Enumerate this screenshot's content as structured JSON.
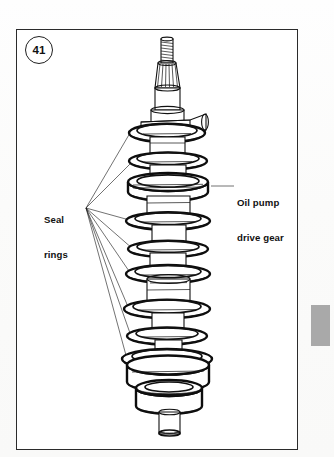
{
  "figure": {
    "number": "41",
    "frame_color": "#2b2b2b",
    "background_color": "#ffffff"
  },
  "labels": {
    "seal_rings": {
      "line1": "Seal",
      "line2": "rings",
      "text": "Seal\nrings"
    },
    "oil_pump_drive_gear": {
      "line1": "Oil pump",
      "line2": "drive gear",
      "text": "Oil pump\ndrive gear"
    }
  },
  "edge_tab": {
    "name": "page-section-tab",
    "color": "#a9a9a9"
  },
  "illustration": {
    "subject": "crankshaft-rotor-shaft-assembly",
    "line_color": "#111111",
    "fill_color": "#ffffff",
    "seal_ring_count": 8,
    "seal_ring_y_positions": [
      132,
      160,
      220,
      248,
      273,
      308,
      335,
      358
    ],
    "oil_pump_gear_y": 187,
    "leader_convergence_point": {
      "x": 86,
      "y": 208
    },
    "oil_pump_leader_line": {
      "x1": 212,
      "y1": 186,
      "x2": 233,
      "y2": 186
    },
    "shaft_center_x": 167
  }
}
